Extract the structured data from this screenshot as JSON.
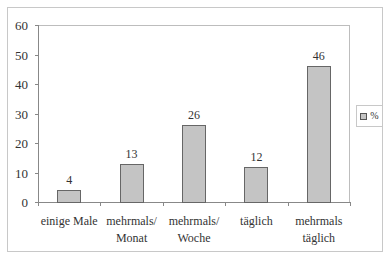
{
  "chart_data": {
    "type": "bar",
    "title": "",
    "xlabel": "",
    "ylabel": "",
    "categories": [
      "einige Male",
      "mehrmals/ Monat",
      "mehrmals/ Woche",
      "täglich",
      "mehrmals täglich"
    ],
    "category_lines": [
      [
        "einige Male"
      ],
      [
        "mehrmals/",
        "Monat"
      ],
      [
        "mehrmals/",
        "Woche"
      ],
      [
        "täglich"
      ],
      [
        "mehrmals",
        "täglich"
      ]
    ],
    "series": [
      {
        "name": "%",
        "values": [
          4,
          13,
          26,
          12,
          46
        ],
        "color": "#c4c4c4"
      }
    ],
    "data_labels": [
      "4",
      "13",
      "26",
      "12",
      "46"
    ],
    "ylim": [
      0,
      60
    ],
    "yticks": [
      "0",
      "10",
      "20",
      "30",
      "40",
      "50",
      "60"
    ],
    "grid": false,
    "legend": {
      "position": "right",
      "entries": [
        "%"
      ]
    }
  }
}
